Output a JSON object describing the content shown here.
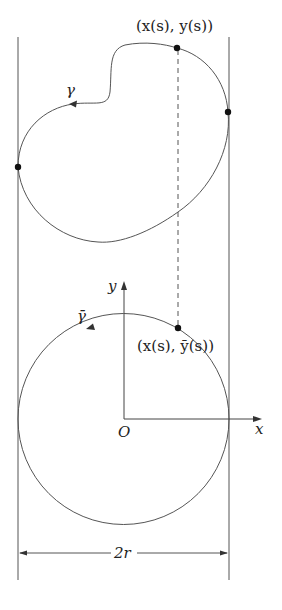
{
  "figure": {
    "labels": {
      "gamma": "γ",
      "gamma_bar": "γ̄",
      "point_upper": "(x(s), y(s))",
      "point_lower": "(x(s), ȳ(s))",
      "origin": "O",
      "x_axis": "x",
      "y_axis": "y",
      "width": "2r"
    },
    "colors": {
      "line": "#555555",
      "dot": "#111111",
      "text": "#222222",
      "background": "#ffffff"
    }
  }
}
